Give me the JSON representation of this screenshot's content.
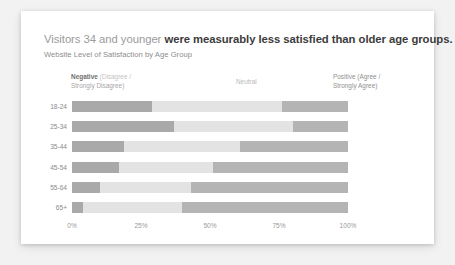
{
  "card": {
    "title_light": "Visitors 34 and younger",
    "title_bold": "were measurably less satisfied than older age groups.",
    "subtitle": "Website Level of Satisfaction by Age Group"
  },
  "legend": {
    "negative_strong": "Negative",
    "negative_soft": " (Disagree /",
    "negative_line2": "Strongly Disagree)",
    "neutral": "Neutral",
    "positive_line1": "Positive (Agree /",
    "positive_line2": "Strongly Agree)"
  },
  "colors": {
    "negative": "#a9a9a9",
    "neutral": "#e3e3e3",
    "positive": "#b4b4b4",
    "card_background": "#ffffff",
    "page_background": "#f2f2f2",
    "title_light": "#9b9b9b",
    "title_bold": "#3c3c3c"
  },
  "chart_data": {
    "type": "bar",
    "title": "Visitors 34 and younger were measurably less satisfied than older age groups.",
    "subtitle": "Website Level of Satisfaction by Age Group",
    "xlabel": "",
    "ylabel": "",
    "orientation": "horizontal",
    "stacked": true,
    "normalized": true,
    "grid": false,
    "legend_position": "top",
    "xlim": [
      0,
      100
    ],
    "xticks": [
      0,
      25,
      50,
      75,
      100
    ],
    "xtick_labels": [
      "0%",
      "25%",
      "50%",
      "75%",
      "100%"
    ],
    "categories": [
      "18-24",
      "25-34",
      "35-44",
      "45-54",
      "55-64",
      "65+"
    ],
    "series": [
      {
        "name": "Negative (Disagree / Strongly Disagree)",
        "color": "#a9a9a9",
        "values": [
          29,
          37,
          19,
          17,
          10,
          4
        ]
      },
      {
        "name": "Neutral",
        "color": "#e3e3e3",
        "values": [
          47,
          43,
          42,
          34,
          33,
          36
        ]
      },
      {
        "name": "Positive (Agree / Strongly Agree)",
        "color": "#b4b4b4",
        "values": [
          24,
          20,
          39,
          49,
          57,
          60
        ]
      }
    ],
    "rows": [
      {
        "category": "18-24",
        "negative": 29,
        "neutral": 47,
        "positive": 24
      },
      {
        "category": "25-34",
        "negative": 37,
        "neutral": 43,
        "positive": 20
      },
      {
        "category": "35-44",
        "negative": 19,
        "neutral": 42,
        "positive": 39
      },
      {
        "category": "45-54",
        "negative": 17,
        "neutral": 34,
        "positive": 49
      },
      {
        "category": "55-64",
        "negative": 10,
        "neutral": 33,
        "positive": 57
      },
      {
        "category": "65+",
        "negative": 4,
        "neutral": 36,
        "positive": 60
      }
    ]
  }
}
